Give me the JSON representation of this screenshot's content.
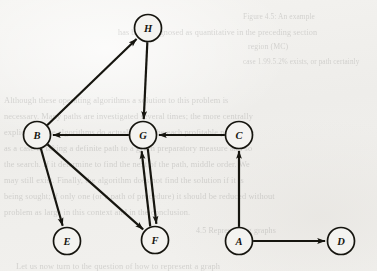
{
  "figure": {
    "kind": "directed-graph",
    "caption": "",
    "background_color": "#f1f0ed",
    "ink_color": "#16150f",
    "node_radius": 13.5,
    "node_fill": "#f4f3f0"
  },
  "graph_data": {
    "type": "diagram",
    "directed": true,
    "node_count": 8,
    "edge_count": 10,
    "nodes": [
      {
        "id": "H",
        "label": "H",
        "x": 148,
        "y": 28
      },
      {
        "id": "B",
        "label": "B",
        "x": 37,
        "y": 135
      },
      {
        "id": "G",
        "label": "G",
        "x": 143,
        "y": 135
      },
      {
        "id": "C",
        "label": "C",
        "x": 239,
        "y": 135
      },
      {
        "id": "E",
        "label": "E",
        "x": 67,
        "y": 241
      },
      {
        "id": "F",
        "label": "F",
        "x": 155,
        "y": 240
      },
      {
        "id": "A",
        "label": "A",
        "x": 239,
        "y": 241
      },
      {
        "id": "D",
        "label": "D",
        "x": 341,
        "y": 241
      }
    ],
    "edges": [
      {
        "from": "B",
        "to": "H",
        "offset": 0
      },
      {
        "from": "H",
        "to": "G",
        "offset": 0
      },
      {
        "from": "G",
        "to": "B",
        "offset": 0
      },
      {
        "from": "C",
        "to": "G",
        "offset": 0
      },
      {
        "from": "B",
        "to": "E",
        "offset": 0
      },
      {
        "from": "B",
        "to": "F",
        "offset": 0
      },
      {
        "from": "G",
        "to": "F",
        "offset": -3.2
      },
      {
        "from": "F",
        "to": "G",
        "offset": -3.2
      },
      {
        "from": "A",
        "to": "C",
        "offset": 0
      },
      {
        "from": "A",
        "to": "D",
        "offset": 0
      }
    ]
  },
  "ghost_text": {
    "note": "faint bleed-through text from the reverse side of the scanned page",
    "lines": [
      {
        "text": "Figure 4.5: An example",
        "x": 243,
        "y": 12,
        "size": 7.4
      },
      {
        "text": "has been diagnosed as quantitative in the preceding section",
        "x": 118,
        "y": 28,
        "size": 8.2
      },
      {
        "text": "region (MC)",
        "x": 248,
        "y": 42,
        "size": 7.8
      },
      {
        "text": "case 1.99.5.2%      exists, or path certainly",
        "x": 243,
        "y": 58,
        "size": 7.2
      },
      {
        "text": "Although these operating algorithms a solution to this problem is",
        "x": 4,
        "y": 96,
        "size": 8.4
      },
      {
        "text": "necessary. Many paths are investigated several times; the more centrally",
        "x": 4,
        "y": 112,
        "size": 8.4
      },
      {
        "text": "explicit, sparse algorithms do actually take the each profitable path to be",
        "x": 4,
        "y": 128,
        "size": 8.4
      },
      {
        "text": "as a case of taking a definite path to a given preparatory measure and so",
        "x": 4,
        "y": 144,
        "size": 8.4
      },
      {
        "text": "the search. If it determine to find the next of the path, middle order. We",
        "x": 4,
        "y": 160,
        "size": 8.4
      },
      {
        "text": "may still exist. Finally, the algorithm does not find the solution if it is",
        "x": 4,
        "y": 176,
        "size": 8.4
      },
      {
        "text": "being sought; if only one (or a path of procedure) it should be reduced without",
        "x": 4,
        "y": 192,
        "size": 8.4
      },
      {
        "text": "problem as large in this context and in the conclusion.",
        "x": 4,
        "y": 208,
        "size": 8.4
      },
      {
        "text": "4.5 Representing graphs",
        "x": 196,
        "y": 226,
        "size": 8.0
      },
      {
        "text": "Let us now turn to the question of how to represent a graph",
        "x": 16,
        "y": 262,
        "size": 8.4
      }
    ]
  }
}
